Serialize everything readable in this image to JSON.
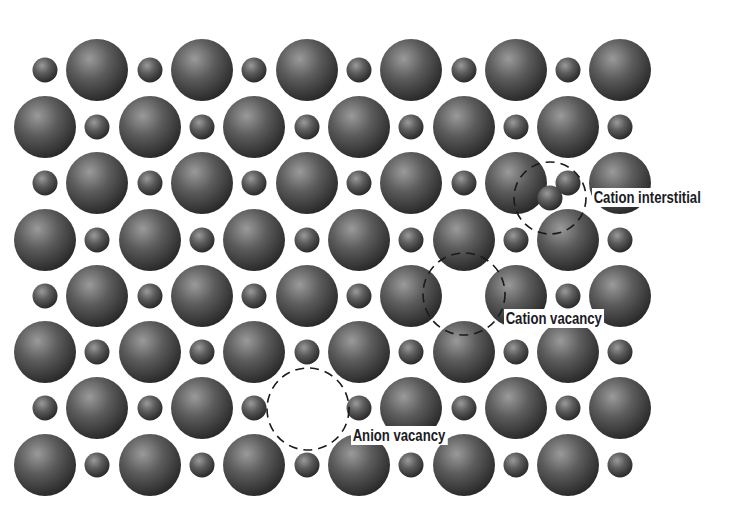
{
  "diagram": {
    "background": "#ffffff",
    "sphere_colors": {
      "highlight": "#9a9a9a",
      "mid": "#5c5c5c",
      "shadow": "#262626"
    },
    "grid": {
      "columns_x": [
        45,
        97,
        150,
        202,
        254,
        307,
        359,
        411,
        464,
        516,
        568,
        620
      ],
      "rows_y": [
        70,
        127,
        183,
        240,
        296,
        352,
        408,
        465
      ],
      "anion_radius": 31,
      "cation_radius": 12.5,
      "pattern": "odd rows start with cation; even rows start with anion"
    },
    "missing_sites": [
      {
        "row": 4,
        "col": 8,
        "type": "cation"
      },
      {
        "row": 6,
        "col": 5,
        "type": "anion"
      }
    ],
    "extra_sites": [
      {
        "x": 550,
        "y": 198,
        "type": "cation"
      }
    ],
    "defects": [
      {
        "name": "Cation interstitial",
        "circle": {
          "cx": 550,
          "cy": 198,
          "r": 36
        },
        "label_pos": {
          "x": 592,
          "y": 188
        }
      },
      {
        "name": "Cation vacancy",
        "circle": {
          "cx": 464,
          "cy": 294,
          "r": 41
        },
        "label_pos": {
          "x": 504,
          "y": 309
        }
      },
      {
        "name": "Anion vacancy",
        "circle": {
          "cx": 308,
          "cy": 409,
          "r": 41
        },
        "label_pos": {
          "x": 351,
          "y": 426
        }
      }
    ]
  },
  "labels": {
    "cation_interstitial": "Cation interstitial",
    "cation_vacancy": "Cation vacancy",
    "anion_vacancy": "Anion vacancy"
  }
}
